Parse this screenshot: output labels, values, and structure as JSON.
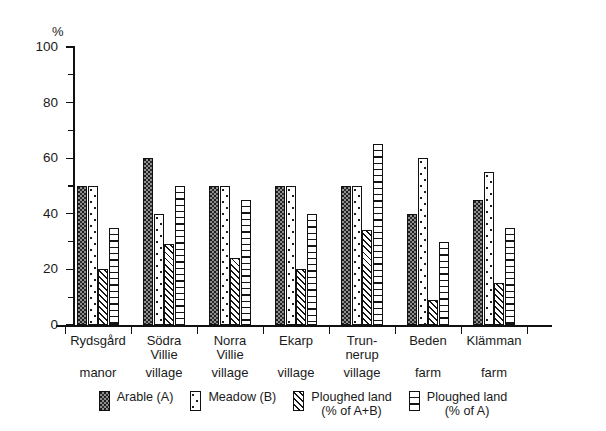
{
  "chart_data": {
    "type": "bar",
    "title": "",
    "xlabel": "",
    "ylabel": "%",
    "ylim": [
      0,
      100
    ],
    "ytick_values": [
      0,
      20,
      40,
      60,
      80,
      100
    ],
    "yminor_tick_values": [
      10,
      30,
      50,
      70,
      90
    ],
    "grid": false,
    "legend_position": "bottom",
    "categories": [
      "Rydsgård manor",
      "Södra Villie village",
      "Norra Villie village",
      "Ekarp village",
      "Trunnerup village",
      "Beden farm",
      "Klämman farm"
    ],
    "category_lines": [
      {
        "l1": "Rydsgård",
        "l2": "",
        "l3": "manor"
      },
      {
        "l1": "Södra",
        "l2": "Villie",
        "l3": "village"
      },
      {
        "l1": "Norra",
        "l2": "Villie",
        "l3": "village"
      },
      {
        "l1": "Ekarp",
        "l2": "",
        "l3": "village"
      },
      {
        "l1": "Trun-",
        "l2": "nerup",
        "l3": "village"
      },
      {
        "l1": "Beden",
        "l2": "",
        "l3": "farm"
      },
      {
        "l1": "Klämman",
        "l2": "",
        "l3": "farm"
      }
    ],
    "series": [
      {
        "name": "Arable (A)",
        "pattern": "dark-stipple",
        "values": [
          50,
          60,
          50,
          50,
          50,
          40,
          45
        ]
      },
      {
        "name": "Meadow (B)",
        "pattern": "sparse-dots",
        "values": [
          50,
          40,
          50,
          50,
          50,
          60,
          55
        ]
      },
      {
        "name": "Ploughed land (% of A+B)",
        "pattern": "diagonal-hatch",
        "values": [
          20,
          29,
          24,
          20,
          34,
          9,
          15
        ]
      },
      {
        "name": "Ploughed land (% of A)",
        "pattern": "horizontal",
        "values": [
          35,
          50,
          45,
          40,
          65,
          30,
          35
        ]
      }
    ]
  },
  "legend": {
    "items": [
      {
        "line1": "Arable (A)",
        "line2": "",
        "swatch": "dark-stipple"
      },
      {
        "line1": "Meadow (B)",
        "line2": "",
        "swatch": "sparse-dots"
      },
      {
        "line1": "Ploughed land",
        "line2": "(% of A+B)",
        "swatch": "diagonal-hatch"
      },
      {
        "line1": "Ploughed land",
        "line2": "(% of A)",
        "swatch": "horizontal"
      }
    ]
  },
  "colors": {
    "axis": "#111111",
    "arable_fill": "#8f8f8f",
    "background": "#ffffff"
  }
}
